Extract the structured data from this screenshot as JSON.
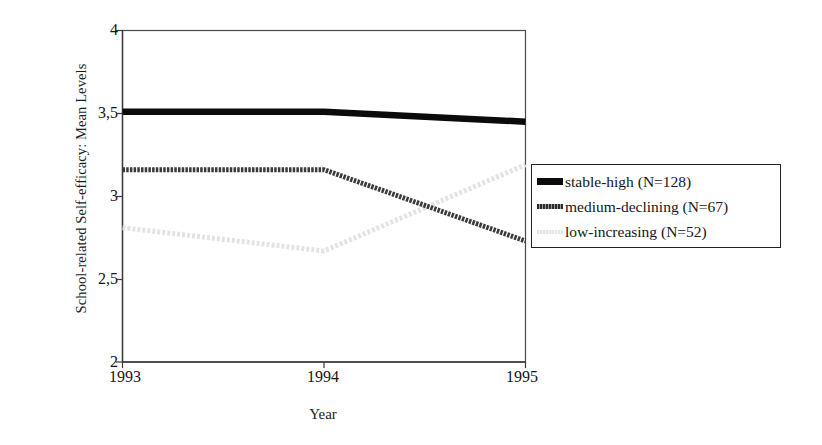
{
  "chart_data": {
    "type": "line",
    "title": "",
    "xlabel": "Year",
    "ylabel": "School-related Self-efficacy: Mean Levels",
    "x": [
      "1993",
      "1994",
      "1995"
    ],
    "xticklabels": [
      "1993",
      "1994",
      "1995"
    ],
    "yticklabels": [
      "2",
      "2,5",
      "3",
      "3,5",
      "4"
    ],
    "ytickvalues": [
      2,
      2.5,
      3,
      3.5,
      4
    ],
    "ylim": [
      2,
      4
    ],
    "grid": false,
    "legend_position": "right",
    "series": [
      {
        "name": "stable-high (N=128)",
        "short_name": "stable-high",
        "n": 128,
        "color": "#0b0b0b",
        "style": "solid-thick",
        "values": [
          3.51,
          3.51,
          3.45
        ]
      },
      {
        "name": "medium-declining (N=67)",
        "short_name": "medium-declining",
        "n": 67,
        "color": "#3a3a3a",
        "style": "dotted-medium",
        "values": [
          3.16,
          3.16,
          2.73
        ]
      },
      {
        "name": "low-increasing (N=52)",
        "short_name": "low-increasing",
        "n": 52,
        "color": "#e3e3e3",
        "style": "dotted-light",
        "values": [
          2.81,
          2.67,
          3.19
        ]
      }
    ]
  },
  "axes": {
    "y_title": "School-related Self-efficacy: Mean Levels",
    "x_title": "Year",
    "y_ticks": [
      {
        "label": "4",
        "value": 4
      },
      {
        "label": "3,5",
        "value": 3.5
      },
      {
        "label": "3",
        "value": 3
      },
      {
        "label": "2,5",
        "value": 2.5
      },
      {
        "label": "2",
        "value": 2
      }
    ],
    "x_ticks": [
      {
        "label": "1993",
        "value": 0
      },
      {
        "label": "1994",
        "value": 1
      },
      {
        "label": "1995",
        "value": 2
      }
    ]
  },
  "legend": {
    "items": [
      {
        "label": "stable-high (N=128)",
        "swatch": "line-swatch-stable-high"
      },
      {
        "label": "medium-declining (N=67)",
        "swatch": "line-swatch-medium-declining"
      },
      {
        "label": "low-increasing (N=52)",
        "swatch": "line-swatch-low-increasing"
      }
    ]
  },
  "colors": {
    "axis": "#3d3d3d",
    "series_stable_high": "#0b0b0b",
    "series_medium_declining": "#3a3a3a",
    "series_low_increasing": "#e3e3e3",
    "background": "#ffffff"
  }
}
